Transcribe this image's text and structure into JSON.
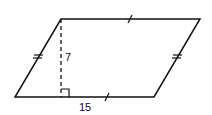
{
  "figure": {
    "type": "parallelogram",
    "vertices": {
      "top_left": [
        61,
        19
      ],
      "top_right": [
        200,
        19
      ],
      "bottom_right": [
        154,
        97
      ],
      "bottom_left": [
        15,
        97
      ]
    },
    "height_label": "7",
    "base_label": "15",
    "stroke_color": "#111111",
    "tick_marks": {
      "top_and_bottom": "single",
      "left_and_right": "double"
    },
    "altitude": "dashed",
    "right_angle_marker": true
  }
}
